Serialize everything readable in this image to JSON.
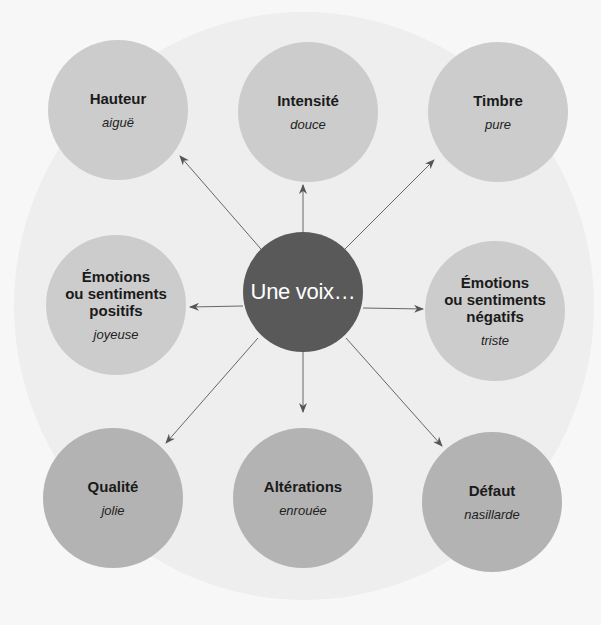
{
  "diagram": {
    "center": {
      "label": "Une voix…",
      "color": "#595959"
    },
    "nodes": [
      {
        "title": "Hauteur",
        "example": "aiguë",
        "color": "#cccccc"
      },
      {
        "title": "Intensité",
        "example": "douce",
        "color": "#cccccc"
      },
      {
        "title": "Timbre",
        "example": "pure",
        "color": "#cccccc"
      },
      {
        "title": "Émotions\nou sentiments\npositifs",
        "example": "joyeuse",
        "color": "#cccccc"
      },
      {
        "title": "Émotions\nou sentiments\nnégatifs",
        "example": "triste",
        "color": "#cccccc"
      },
      {
        "title": "Qualité",
        "example": "jolie",
        "color": "#b3b3b3"
      },
      {
        "title": "Altérations",
        "example": "enrouée",
        "color": "#b3b3b3"
      },
      {
        "title": "Défaut",
        "example": "nasillarde",
        "color": "#b3b3b3"
      }
    ],
    "background_color": "#eeeeee",
    "arrow_color": "#555555"
  }
}
